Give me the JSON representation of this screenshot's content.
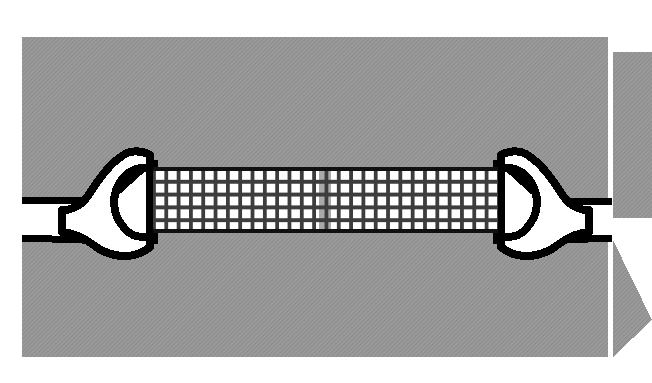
{
  "figure": {
    "name": "crack-bridging-mesh-diagram",
    "width": 652,
    "height": 383,
    "background_color": "#ffffff"
  },
  "colors": {
    "substrate_gray": "#969696",
    "substrate_gray_dark": "#8d8d8d",
    "mesh_grid_line": "#3a3a3a",
    "mesh_cell_fill": "#ffffff",
    "mesh_highlight_cell_fill": "#a9a9a9",
    "mesh_border": "#000000",
    "clamp_fill": "#ffffff",
    "clamp_outline": "#000000",
    "crack_line": "#000000",
    "wedge_gray": "#969696"
  },
  "substrate": {
    "label": "gray substrate block",
    "x": 22,
    "y": 37,
    "width": 586,
    "height": 320,
    "texture": "fine diagonal hatch"
  },
  "wedges": [
    {
      "label": "upper displaced wedge",
      "points": "613,52 652,52 652,218 613,218 652,135",
      "apex_x": 652,
      "apex_y": 135
    },
    {
      "label": "lower displaced wedge",
      "points": "613,240 652,240 652,357 613,357 652,298",
      "apex_x": 652,
      "apex_y": 298
    }
  ],
  "crack": {
    "label": "fissure / crack in substrate",
    "upper_line_y": 202,
    "lower_line_y": 238,
    "stroke_width": 7,
    "left_extent_x": 22,
    "right_extent_x": 608
  },
  "mesh": {
    "label": "reinforcement mesh band",
    "x": 153,
    "y": 168,
    "width": 345,
    "height": 64,
    "columns": 28,
    "rows": 5,
    "cell_width": 12.3,
    "cell_height": 12.8,
    "border_width": 5,
    "highlight_column_index": 13,
    "highlight_column_x": 319,
    "highlight_column_width": 12.3
  },
  "clamps": [
    {
      "label": "left clamp jaw",
      "side": "left",
      "tip_x": 153,
      "body_center_x": 105,
      "center_y": 200
    },
    {
      "label": "right clamp jaw",
      "side": "right",
      "tip_x": 498,
      "body_center_x": 546,
      "center_y": 200
    }
  ],
  "chart_data": {
    "type": "table",
    "columns": 28,
    "rows": 5,
    "highlighted_column": 14,
    "cell_states": [
      "open",
      "open",
      "open",
      "open",
      "open",
      "open",
      "open",
      "open",
      "open",
      "open",
      "open",
      "open",
      "open",
      "filled",
      "open",
      "open",
      "open",
      "open",
      "open",
      "open",
      "open",
      "open",
      "open",
      "open",
      "open",
      "open",
      "open",
      "open"
    ]
  }
}
